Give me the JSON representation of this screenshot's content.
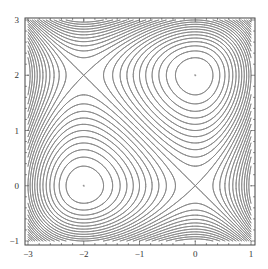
{
  "chart_data": {
    "type": "contour",
    "title": "",
    "xlabel": "",
    "ylabel": "",
    "xlim": [
      -3,
      1
    ],
    "ylim": [
      -1,
      3
    ],
    "x_ticks": [
      -3,
      -2,
      -1,
      0,
      1
    ],
    "y_ticks": [
      -1,
      0,
      1,
      2,
      3
    ],
    "x_tick_labels": [
      "−3",
      "−2",
      "−1",
      "0",
      "1"
    ],
    "y_tick_labels": [
      "−1",
      "0",
      "1",
      "2",
      "3"
    ],
    "function": "f(x,y) = x^3 + y^3 + 3x^2 - 3y^2",
    "contour_step": 0.3333,
    "level_range": [
      -12,
      12
    ],
    "critical_points": [
      {
        "x": 0,
        "y": 2,
        "type": "local minimum",
        "value": -4
      },
      {
        "x": -2,
        "y": 0,
        "type": "local maximum",
        "value": 4
      },
      {
        "x": 0,
        "y": 0,
        "type": "saddle",
        "value": 0
      },
      {
        "x": -2,
        "y": 2,
        "type": "saddle",
        "value": 0
      }
    ],
    "grid": false,
    "legend": "none"
  },
  "style": {
    "line_color": "#8a8a8a",
    "frame_color": "#444444",
    "background": "#ffffff"
  }
}
